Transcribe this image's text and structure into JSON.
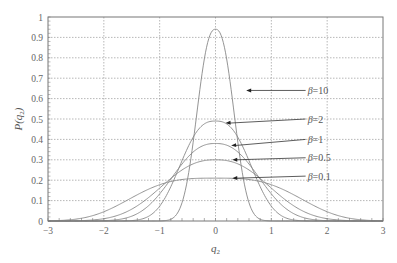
{
  "chart_data": {
    "type": "line",
    "title": "",
    "xlabel": "q2",
    "ylabel": "P(q2)",
    "xlim": [
      -3,
      3
    ],
    "ylim": [
      0,
      1
    ],
    "xticks": [
      -3,
      -2,
      -1,
      0,
      1,
      2,
      3
    ],
    "xtick_labels": [
      "−3",
      "−2",
      "−1",
      "0",
      "1",
      "2",
      "3"
    ],
    "yticks": [
      0,
      0.1,
      0.2,
      0.3,
      0.4,
      0.5,
      0.6,
      0.7,
      0.8,
      0.9,
      1
    ],
    "ytick_labels": [
      "0",
      "0.1",
      "0.2",
      "0.3",
      "0.4",
      "0.5",
      "0.6",
      "0.7",
      "0.8",
      "0.9",
      "1"
    ],
    "grid": true,
    "legend": "inline annotations with arrows",
    "series": [
      {
        "name": "β=10",
        "peak": 0.94,
        "x": [
          -3,
          -1,
          -0.8,
          -0.6,
          -0.4,
          -0.2,
          0,
          0.2,
          0.4,
          0.6,
          0.8,
          1,
          3
        ],
        "values": [
          0,
          0.0,
          0.08,
          0.36,
          0.66,
          0.87,
          0.94,
          0.87,
          0.66,
          0.36,
          0.08,
          0.0,
          0
        ]
      },
      {
        "name": "β=2",
        "peak": 0.49,
        "x": [
          -3,
          -2,
          -1,
          -0.5,
          0,
          0.5,
          1,
          1.2,
          1.5,
          2,
          3
        ],
        "values": [
          0.01,
          0.06,
          0.29,
          0.43,
          0.49,
          0.43,
          0.22,
          0.1,
          0.02,
          0,
          0
        ]
      },
      {
        "name": "β=1",
        "peak": 0.38,
        "x": [
          -3,
          -2,
          -1,
          -0.5,
          0,
          0.5,
          1,
          1.3,
          1.6,
          2,
          3
        ],
        "values": [
          0.05,
          0.14,
          0.29,
          0.35,
          0.38,
          0.35,
          0.25,
          0.12,
          0.04,
          0.01,
          0
        ]
      },
      {
        "name": "β=0.5",
        "peak": 0.3,
        "x": [
          -3,
          -2,
          -1,
          -0.5,
          0,
          0.5,
          1,
          1.4,
          1.8,
          2.2,
          3
        ],
        "values": [
          0.1,
          0.19,
          0.27,
          0.29,
          0.3,
          0.29,
          0.24,
          0.12,
          0.04,
          0.01,
          0
        ]
      },
      {
        "name": "β=0.1",
        "peak": 0.21,
        "x": [
          -3,
          -2,
          -1,
          0,
          0.8,
          1.2,
          1.6,
          2,
          2.4,
          2.8,
          3
        ],
        "values": [
          0.18,
          0.2,
          0.21,
          0.21,
          0.2,
          0.17,
          0.12,
          0.07,
          0.03,
          0.01,
          0
        ]
      }
    ],
    "annotations": [
      {
        "text": "β=10",
        "label_x": 1.65,
        "label_y": 0.64,
        "arrow_to_x": 0.55,
        "arrow_to_y": 0.64
      },
      {
        "text": "β=2",
        "label_x": 1.65,
        "label_y": 0.5,
        "arrow_to_x": 0.18,
        "arrow_to_y": 0.48
      },
      {
        "text": "β=1",
        "label_x": 1.65,
        "label_y": 0.4,
        "arrow_to_x": 0.28,
        "arrow_to_y": 0.37
      },
      {
        "text": "β=0.5",
        "label_x": 1.65,
        "label_y": 0.31,
        "arrow_to_x": 0.3,
        "arrow_to_y": 0.3
      },
      {
        "text": "β=0.1",
        "label_x": 1.65,
        "label_y": 0.22,
        "arrow_to_x": 0.3,
        "arrow_to_y": 0.21
      }
    ]
  },
  "colors": {
    "curve": "#888888",
    "grid": "#999999",
    "frame": "#777777",
    "text": "#555555"
  }
}
